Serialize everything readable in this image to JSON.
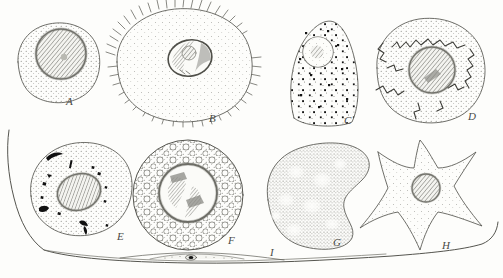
{
  "plate": {
    "kind": "histology-plate",
    "technique": "pen-and-ink stipple drawing",
    "background_color": "#fdfdfb",
    "ink_color": "#4a4a46",
    "nucleus_hatch_color": "#8a8a86",
    "granule_color": "#1b1b1b",
    "width": 503,
    "height": 278,
    "cell_count": 9
  },
  "labels": {
    "a": "A",
    "b": "B",
    "c": "C",
    "d": "D",
    "e": "E",
    "f": "F",
    "g": "G",
    "h": "H",
    "i": "I"
  },
  "cells": [
    {
      "label": "A",
      "name": "round-cell-stippled",
      "shape": "rounded irregular blob",
      "cytoplasm": "fine even stipple",
      "nucleus": "large round, diagonal hatching, dark rim",
      "row": 1,
      "column": 1
    },
    {
      "label": "B",
      "name": "spiny-cell-with-filopodia",
      "shape": "large oval with spiky radiating processes on margin",
      "cytoplasm": "fine sparse stipple",
      "nucleus": "oval, partly hatched with clear zones",
      "row": 1,
      "column": 2
    },
    {
      "label": "C",
      "name": "granular-teardrop-cell",
      "shape": "teardrop / triangular",
      "cytoplasm": "coarse dark granules over fine stipple",
      "nucleus": "small round, faint cross-hatch, near apex",
      "row": 1,
      "column": 3
    },
    {
      "label": "D",
      "name": "cell-with-canalicular-network",
      "shape": "round",
      "cytoplasm": "stippled with jagged zigzag channel network",
      "nucleus": "central round, diagonal hatching",
      "row": 1,
      "column": 4
    },
    {
      "label": "E",
      "name": "cell-with-pigment-inclusions",
      "shape": "oval, tilted",
      "cytoplasm": "stippled with scattered black crescent and comma inclusions",
      "nucleus": "oval, diagonal hatching",
      "row": 2,
      "column": 1
    },
    {
      "label": "F",
      "name": "vacuolated-cell",
      "shape": "round",
      "cytoplasm": "densely packed open vacuoles on stipple",
      "nucleus": "large round, irregular hatched bands",
      "row": 2,
      "column": 2
    },
    {
      "label": "G",
      "name": "kidney-shaped-cell",
      "shape": "reniform / bean-shaped with notch on right",
      "cytoplasm": "dense fine stipple with pale vacuole patches",
      "nucleus": "not visible",
      "row": 2,
      "column": 3
    },
    {
      "label": "H",
      "name": "stellate-cell",
      "shape": "star-shaped with five to six tapering processes",
      "cytoplasm": "light sparse stipple",
      "nucleus": "small round, diagonal hatching",
      "row": 2,
      "column": 4
    },
    {
      "label": "I",
      "name": "flattened-squamous-cell",
      "shape": "very long thin flattened sheet spanning the plate base",
      "cytoplasm": "membrane in profile, almost a line",
      "nucleus": "small dark lenticular nucleus near middle",
      "row": 3,
      "column": "full-width"
    }
  ]
}
